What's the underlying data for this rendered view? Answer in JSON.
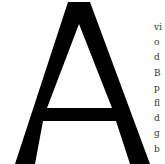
{
  "specimen": {
    "big_letter": "A",
    "letter_color": "#000000",
    "background_color": "#ffffff",
    "text_color": "#333333",
    "text_lines": [
      "vi",
      "o",
      "d",
      "B",
      "p",
      "fl",
      "d",
      "g",
      "b"
    ]
  }
}
